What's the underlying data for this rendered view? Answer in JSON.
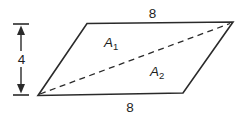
{
  "figure": {
    "shape": "parallelogram",
    "labels": {
      "top_side": "8",
      "bottom_side": "8",
      "height": "4",
      "region1": {
        "base": "A",
        "sub": "1"
      },
      "region2": {
        "base": "A",
        "sub": "2"
      }
    },
    "colors": {
      "line": "#2a2a2a",
      "text": "#1e1e1e",
      "background": "#ffffff"
    }
  }
}
